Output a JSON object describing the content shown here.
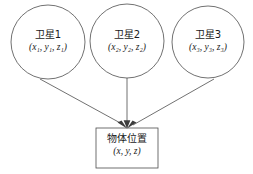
{
  "diagram": {
    "type": "satellite-positioning-block-diagram",
    "colors": {
      "background": "#ffffff",
      "stroke": "#4d4d4d",
      "text": "#1a1a1a"
    },
    "nodes": [
      {
        "id": "satellite-1",
        "shape": "circle",
        "title": "卫星1",
        "coords_open": "(",
        "coords": "x",
        "full_coords": "(x₁, y₁, z₁)",
        "sub": "1",
        "cx": 48,
        "cy": 42,
        "r": 37
      },
      {
        "id": "satellite-2",
        "shape": "circle",
        "title": "卫星2",
        "full_coords": "(x₂, y₂, z₂)",
        "sub": "2",
        "cx": 127,
        "cy": 41,
        "r": 37
      },
      {
        "id": "satellite-3",
        "shape": "circle",
        "title": "卫星3",
        "full_coords": "(x₃, y₃, z₃)",
        "sub": "3",
        "cx": 208,
        "cy": 42,
        "r": 36
      },
      {
        "id": "object-position",
        "shape": "rect",
        "title": "物体位置",
        "full_coords": "(x, y, z)",
        "x": 96,
        "y": 128,
        "width": 62,
        "height": 40
      }
    ],
    "edges": [
      {
        "id": "edge-sat1-to-object",
        "from": "satellite-1",
        "to": "object-position",
        "arrowhead": true
      },
      {
        "id": "edge-sat2-to-object",
        "from": "satellite-2",
        "to": "object-position",
        "arrowhead": true
      },
      {
        "id": "edge-sat3-to-object",
        "from": "satellite-3",
        "to": "object-position",
        "arrowhead": true
      }
    ]
  }
}
